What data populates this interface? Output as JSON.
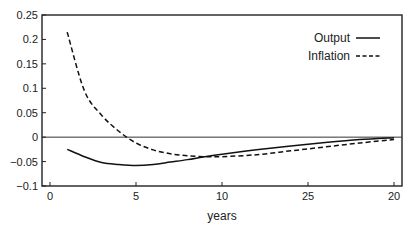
{
  "chart_data": {
    "type": "line",
    "title": "",
    "xlabel": "years",
    "ylabel": "",
    "xlim": [
      -0.5,
      20.5
    ],
    "ylim": [
      -0.1,
      0.25
    ],
    "x_ticks": [
      {
        "value": 0,
        "label": "0"
      },
      {
        "value": 5,
        "label": "5"
      },
      {
        "value": 10,
        "label": "10"
      },
      {
        "value": 15,
        "label": "25"
      },
      {
        "value": 20,
        "label": "20"
      }
    ],
    "y_ticks": [
      {
        "value": 0.25,
        "label": "0.25"
      },
      {
        "value": 0.2,
        "label": "0.2"
      },
      {
        "value": 0.15,
        "label": "0.15"
      },
      {
        "value": 0.1,
        "label": "0.1"
      },
      {
        "value": 0.05,
        "label": "0.05"
      },
      {
        "value": 0,
        "label": "0"
      },
      {
        "value": -0.05,
        "label": "-0.05"
      },
      {
        "value": -0.1,
        "label": "-0.1"
      }
    ],
    "grid": false,
    "zero_line": true,
    "legend_position": "upper right",
    "series": [
      {
        "name": "Output",
        "style": "solid",
        "x": [
          1,
          2,
          3,
          4,
          5,
          6,
          7,
          8,
          9,
          10,
          12,
          14,
          16,
          18,
          20
        ],
        "y": [
          -0.025,
          -0.04,
          -0.052,
          -0.056,
          -0.058,
          -0.056,
          -0.051,
          -0.046,
          -0.04,
          -0.035,
          -0.026,
          -0.018,
          -0.011,
          -0.005,
          -0.001
        ]
      },
      {
        "name": "Inflation",
        "style": "dashed",
        "x": [
          1,
          2,
          3,
          4,
          5,
          6,
          7,
          8,
          9,
          10,
          12,
          14,
          16,
          18,
          20
        ],
        "y": [
          0.215,
          0.095,
          0.045,
          0.012,
          -0.012,
          -0.026,
          -0.034,
          -0.038,
          -0.04,
          -0.04,
          -0.036,
          -0.028,
          -0.02,
          -0.012,
          -0.005
        ]
      }
    ]
  }
}
